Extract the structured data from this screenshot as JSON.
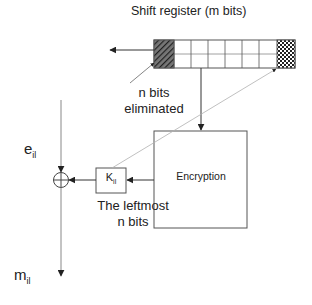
{
  "diagram": {
    "title": "Shift register (m bits)",
    "register": {
      "cells": 8,
      "left_cell_pattern": "diagonal-hatch",
      "right_cell_pattern": "checkerboard"
    },
    "labels": {
      "eliminated_line1": "n bits",
      "eliminated_line2": "eliminated",
      "encryption": "Encryption",
      "key_base": "K",
      "key_sub": "il",
      "leftmost_line1": "The leftmost",
      "leftmost_line2": "n bits",
      "input_base": "e",
      "input_sub": "il",
      "output_base": "m",
      "output_sub": "il"
    },
    "operator": "XOR",
    "colors": {
      "line": "#444444",
      "faint_line": "#b0b0b0",
      "box_border": "#555555",
      "hatch": "#333333"
    }
  }
}
